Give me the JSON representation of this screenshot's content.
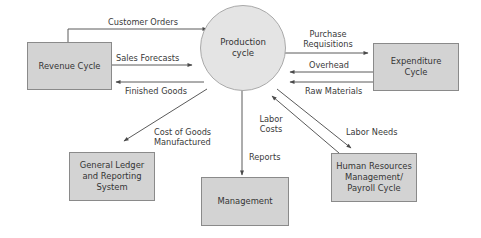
{
  "diagram": {
    "center": {
      "label": "Production cycle",
      "line1": "Production",
      "line2": "cycle"
    },
    "nodes": {
      "revenue": {
        "line1": "Revenue Cycle"
      },
      "expenditure": {
        "line1": "Expenditure",
        "line2": "Cycle"
      },
      "general_ledger": {
        "line1": "General Ledger",
        "line2": "and Reporting",
        "line3": "System"
      },
      "management": {
        "line1": "Management"
      },
      "hr": {
        "line1": "Human Resources",
        "line2": "Management/",
        "line3": "Payroll Cycle"
      }
    },
    "flows": {
      "customer_orders": {
        "label": "Customer Orders",
        "from": "Revenue Cycle",
        "to": "Production cycle"
      },
      "sales_forecasts": {
        "label": "Sales Forecasts",
        "from": "Revenue Cycle",
        "to": "Production cycle"
      },
      "finished_goods": {
        "label": "Finished Goods",
        "from": "Production cycle",
        "to": "Revenue Cycle"
      },
      "purchase_requisitions": {
        "line1": "Purchase",
        "line2": "Requisitions",
        "from": "Production cycle",
        "to": "Expenditure Cycle"
      },
      "overhead": {
        "label": "Overhead",
        "from": "Expenditure Cycle",
        "to": "Production cycle"
      },
      "raw_materials": {
        "label": "Raw Materials",
        "from": "Expenditure Cycle",
        "to": "Production cycle"
      },
      "cost_of_goods": {
        "line1": "Cost of Goods",
        "line2": "Manufactured",
        "from": "Production cycle",
        "to": "General Ledger and Reporting System"
      },
      "reports": {
        "label": "Reports",
        "from": "Production cycle",
        "to": "Management"
      },
      "labor_costs": {
        "line1": "Labor",
        "line2": "Costs",
        "from": "Human Resources Management/Payroll Cycle",
        "to": "Production cycle"
      },
      "labor_needs": {
        "label": "Labor Needs",
        "from": "Production cycle",
        "to": "Human Resources Management/Payroll Cycle"
      }
    },
    "colors": {
      "box_fill": "#d3d3d3",
      "circle_fill": "#e4e4e4",
      "line": "#4a4a4a"
    }
  }
}
